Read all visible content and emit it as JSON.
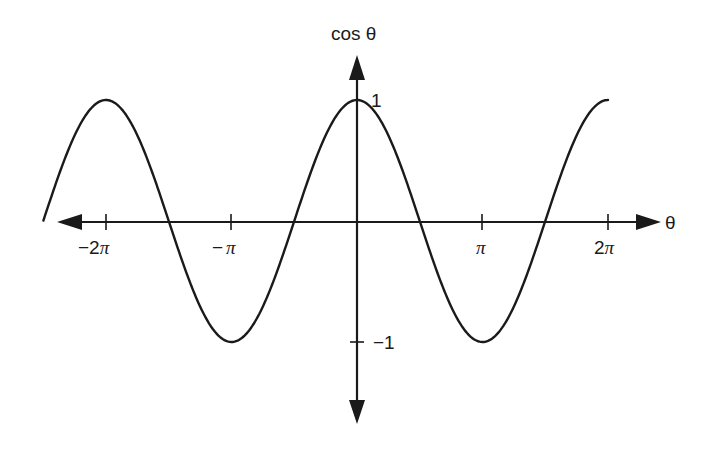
{
  "chart_data": {
    "type": "line",
    "title": "",
    "xlabel": "θ",
    "ylabel": "cos θ",
    "function": "cos(θ)",
    "x_range": [
      -7.85,
      6.2832
    ],
    "ylim": [
      -1,
      1
    ],
    "x_ticks": [
      {
        "value": -6.2832,
        "label": "−2π"
      },
      {
        "value": -3.1416,
        "label": "−π"
      },
      {
        "value": 3.1416,
        "label": "π"
      },
      {
        "value": 6.2832,
        "label": "2π"
      }
    ],
    "y_ticks": [
      {
        "value": 1,
        "label": "1"
      },
      {
        "value": -1,
        "label": "−1"
      }
    ],
    "series": [
      {
        "name": "cos θ",
        "x": [
          -7.85,
          -6.2832,
          -4.7124,
          -3.1416,
          -1.5708,
          0,
          1.5708,
          3.1416,
          4.7124,
          6.2832
        ],
        "values": [
          0,
          1,
          0,
          -1,
          0,
          1,
          0,
          -1,
          0,
          1
        ]
      }
    ],
    "grid": false,
    "legend": "none",
    "colors": {
      "line": "#1a1a1a",
      "axis": "#1a1a1a"
    }
  },
  "labels": {
    "y_axis": "cos θ",
    "x_axis": "θ",
    "tick_neg2pi_minus": "−2",
    "tick_neg2pi_pi": "π",
    "tick_negpi_minus": "−",
    "tick_negpi_pi": "π",
    "tick_pi": "π",
    "tick_2pi_num": "2",
    "tick_2pi_pi": "π",
    "tick_y_pos1": "1",
    "tick_y_neg1": "−1"
  }
}
